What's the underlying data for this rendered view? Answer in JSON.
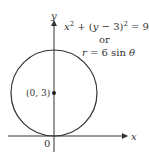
{
  "diagram": {
    "axes": {
      "x_label": "x",
      "y_label": "y",
      "origin_label": "0"
    },
    "circle": {
      "center_label": "(0, 3)",
      "equation_cartesian": {
        "lhs_x": "x",
        "lhs_x_exp": "2",
        "plus": " + (",
        "lhs_y": "y",
        "minus_three": " − 3)",
        "exp": "2",
        "rhs": " = 9"
      },
      "connector": "or",
      "equation_polar": {
        "r": "r",
        "eq": " = 6 sin ",
        "theta": "θ"
      }
    },
    "colors": {
      "stroke": "#333333",
      "text": "#333333"
    }
  }
}
